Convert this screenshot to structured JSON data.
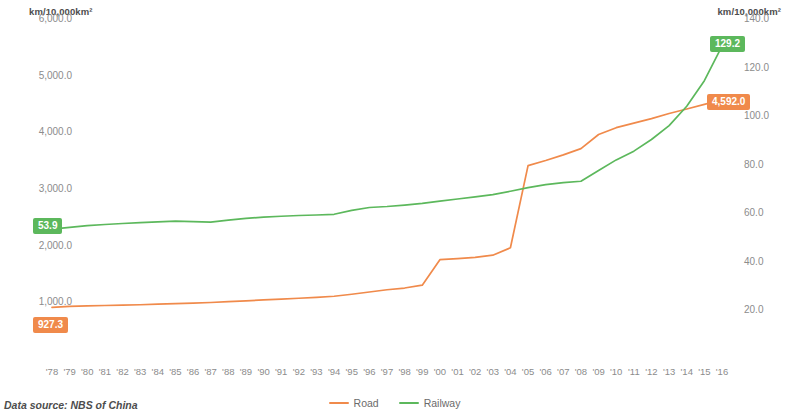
{
  "axis_unit_left": "km/10,000km²",
  "axis_unit_right": "km/10,000km²",
  "source_note": "Data source: NBS of China",
  "legend": {
    "items": [
      {
        "label": "Road",
        "color": "#f08a4b"
      },
      {
        "label": "Railway",
        "color": "#5cb85c"
      }
    ]
  },
  "badges": {
    "rail_start": "53.9",
    "road_start": "927.3",
    "rail_end": "129.2",
    "road_end": "4,592.0"
  },
  "chart_data": {
    "type": "line",
    "title": "",
    "xlabel": "",
    "ylabel": "km/10,000km²",
    "grid": false,
    "legend_position": "bottom-center",
    "categories": [
      "'78",
      "'79",
      "'80",
      "'81",
      "'82",
      "'83",
      "'84",
      "'85",
      "'86",
      "'87",
      "'88",
      "'89",
      "'90",
      "'91",
      "'92",
      "'93",
      "'94",
      "'95",
      "'96",
      "'97",
      "'98",
      "'99",
      "'00",
      "'01",
      "'02",
      "'03",
      "'04",
      "'05",
      "'06",
      "'07",
      "'08",
      "'09",
      "'10",
      "'11",
      "'12",
      "'13",
      "'14",
      "'15",
      "'16"
    ],
    "x": [
      1978,
      1979,
      1980,
      1981,
      1982,
      1983,
      1984,
      1985,
      1986,
      1987,
      1988,
      1989,
      1990,
      1991,
      1992,
      1993,
      1994,
      1995,
      1996,
      1997,
      1998,
      1999,
      2000,
      2001,
      2002,
      2003,
      2004,
      2005,
      2006,
      2007,
      2008,
      2009,
      2010,
      2011,
      2012,
      2013,
      2014,
      2015,
      2016
    ],
    "series": [
      {
        "name": "Road",
        "color": "#f08a4b",
        "axis": "left",
        "ylabel": "km/10,000km²",
        "ylim": [
          0,
          6000
        ],
        "yticks": [
          "1,000.0",
          "2,000.0",
          "3,000.0",
          "4,000.0",
          "5,000.0",
          "6,000.0"
        ],
        "ytick_values": [
          1000,
          2000,
          3000,
          4000,
          5000,
          6000
        ],
        "values": [
          927.3,
          945,
          955,
          962,
          968,
          975,
          985,
          995,
          1005,
          1015,
          1030,
          1045,
          1060,
          1075,
          1090,
          1105,
          1125,
          1160,
          1200,
          1240,
          1270,
          1320,
          1770,
          1790,
          1810,
          1850,
          1980,
          3430,
          3520,
          3620,
          3730,
          3980,
          4100,
          4180,
          4260,
          4350,
          4430,
          4510,
          4592.0
        ]
      },
      {
        "name": "Railway",
        "color": "#5cb85c",
        "axis": "right",
        "ylabel": "km/10,000km²",
        "ylim": [
          0,
          140
        ],
        "yticks": [
          "20.0",
          "40.0",
          "60.0",
          "80.0",
          "100.0",
          "120.0",
          "140.0"
        ],
        "ytick_values": [
          20,
          40,
          60,
          80,
          100,
          120,
          140
        ],
        "values": [
          53.9,
          54.6,
          55.3,
          55.8,
          56.2,
          56.6,
          56.9,
          57.2,
          57.0,
          56.8,
          57.6,
          58.3,
          58.8,
          59.2,
          59.5,
          59.7,
          60.0,
          61.6,
          62.8,
          63.2,
          63.8,
          64.5,
          65.4,
          66.3,
          67.2,
          68.1,
          69.5,
          71.0,
          72.2,
          73.0,
          73.6,
          78.0,
          82.4,
          86.0,
          90.8,
          96.5,
          104.5,
          115.0,
          129.2
        ]
      }
    ]
  }
}
